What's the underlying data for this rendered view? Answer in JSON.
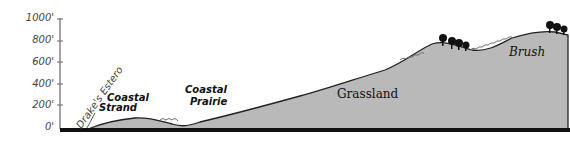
{
  "diagram": {
    "type": "elevation-profile",
    "y_axis": {
      "ticks": [
        "1000'",
        "800'",
        "600'",
        "400'",
        "200'",
        "0'"
      ]
    },
    "labels": {
      "drakes_estero": "Drake's Estero",
      "coastal_strand_line1": "Coastal",
      "coastal_strand_line2": "Strand",
      "coastal_prairie_line1": "Coastal",
      "coastal_prairie_line2": "Prairie",
      "grassland": "Grassland",
      "brush": "Brush"
    },
    "colors": {
      "terrain_fill": "#b8b8b8",
      "baseline": "#111111",
      "tree": "#111111"
    }
  }
}
